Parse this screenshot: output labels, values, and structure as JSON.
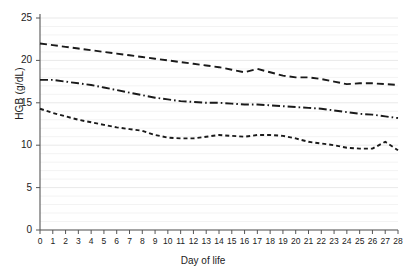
{
  "chart_data": {
    "type": "line",
    "title": "",
    "xlabel": "Day of life",
    "ylabel": "HGB (g/dL)",
    "xlim": [
      0,
      28
    ],
    "ylim": [
      0,
      25
    ],
    "xticks": [
      0,
      1,
      2,
      3,
      4,
      5,
      6,
      7,
      8,
      9,
      10,
      11,
      12,
      13,
      14,
      15,
      16,
      17,
      18,
      19,
      20,
      21,
      22,
      23,
      24,
      25,
      26,
      27,
      28
    ],
    "yticks": [
      0,
      5,
      10,
      15,
      20,
      25
    ],
    "grid": true,
    "legend": "none",
    "x": [
      0,
      1,
      2,
      3,
      4,
      5,
      6,
      7,
      8,
      9,
      10,
      11,
      12,
      13,
      14,
      15,
      16,
      17,
      18,
      19,
      20,
      21,
      22,
      23,
      24,
      25,
      26,
      27,
      28
    ],
    "series": [
      {
        "name": "upper-percentile",
        "dash": "long-dash",
        "color": "#1a1a1a",
        "values": [
          22.0,
          21.8,
          21.6,
          21.4,
          21.2,
          21.0,
          20.8,
          20.6,
          20.4,
          20.2,
          20.0,
          19.8,
          19.6,
          19.4,
          19.2,
          18.9,
          18.6,
          19.0,
          18.6,
          18.2,
          18.0,
          18.0,
          17.8,
          17.5,
          17.2,
          17.3,
          17.3,
          17.2,
          17.1
        ]
      },
      {
        "name": "median",
        "dash": "dash-dot",
        "color": "#1a1a1a",
        "values": [
          17.7,
          17.7,
          17.5,
          17.3,
          17.1,
          16.8,
          16.5,
          16.2,
          15.9,
          15.6,
          15.4,
          15.2,
          15.1,
          15.0,
          15.0,
          14.9,
          14.8,
          14.8,
          14.7,
          14.6,
          14.5,
          14.4,
          14.3,
          14.1,
          13.9,
          13.7,
          13.6,
          13.4,
          13.2
        ]
      },
      {
        "name": "lower-percentile",
        "dash": "short-dash",
        "color": "#1a1a1a",
        "values": [
          14.3,
          13.8,
          13.4,
          13.0,
          12.7,
          12.4,
          12.1,
          11.9,
          11.7,
          11.2,
          10.9,
          10.8,
          10.8,
          11.0,
          11.2,
          11.1,
          11.0,
          11.2,
          11.2,
          11.1,
          10.8,
          10.4,
          10.2,
          10.0,
          9.7,
          9.6,
          9.6,
          10.4,
          9.4
        ]
      }
    ]
  }
}
